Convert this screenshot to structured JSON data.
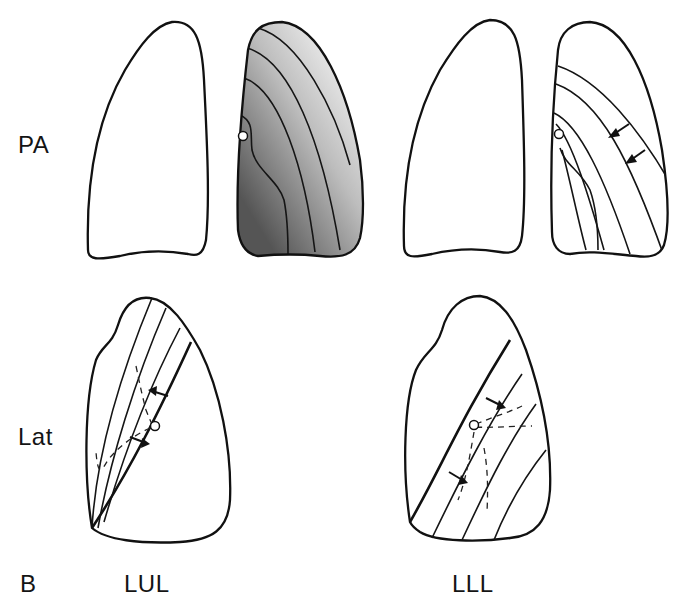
{
  "figure": {
    "panel_letter": "B",
    "row_labels": [
      "PA",
      "Lat"
    ],
    "column_labels": [
      "LUL",
      "LLL"
    ],
    "panels": [
      {
        "view": "PA",
        "lobe": "LUL",
        "description": "PA view: normal right lung outline and left lung with graded shading and contour lines showing LUL collapse toward hilum"
      },
      {
        "view": "PA",
        "lobe": "LLL",
        "description": "PA view: normal right lung outline and left lung with contour lines and arrows showing LLL collapse medially/inferiorly"
      },
      {
        "view": "Lat",
        "lobe": "LUL",
        "description": "Lateral view: major fissure displaced anteriorly with arrows, dashed segmental lines and hilum circle"
      },
      {
        "view": "Lat",
        "lobe": "LLL",
        "description": "Lateral view: major fissure displaced posteriorly with arrows, dashed lines radiating from hilum"
      }
    ],
    "colors": {
      "stroke": "#111111",
      "background": "#ffffff",
      "shade_dark": "#5a5a5a",
      "shade_light": "#f4f4f4"
    }
  }
}
